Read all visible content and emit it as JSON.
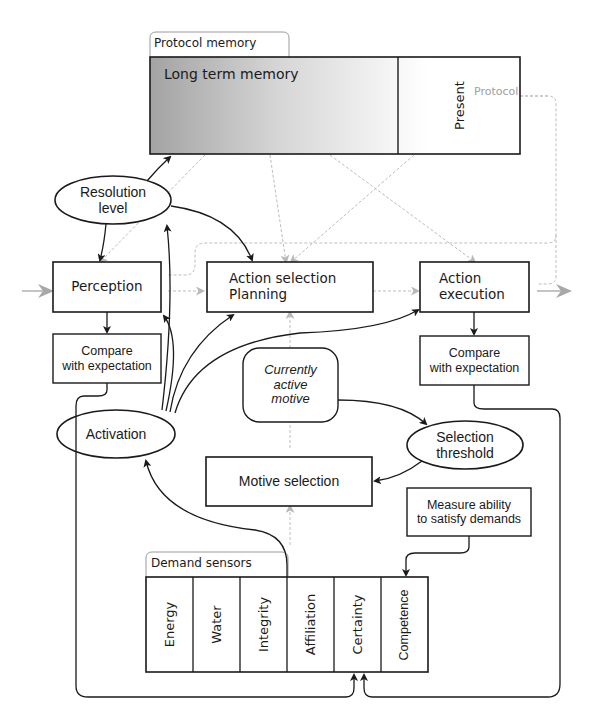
{
  "diagram": {
    "type": "psi-theory-architecture",
    "colors": {
      "line": "#1a1a1a",
      "faint_line": "#b5b5b5",
      "memory_gradient_start": "#a8a8a8",
      "memory_gradient_end": "#ffffff"
    },
    "memory": {
      "tab_label": "Protocol memory",
      "long_term_label": "Long term memory",
      "present_label": "Present",
      "protocol_label": "Protocol"
    },
    "nodes": {
      "resolution_level": "Resolution\nlevel",
      "perception": "Perception",
      "action_selection": "Action selection\nPlanning",
      "action_execution": "Action\nexecution",
      "compare_left": "Compare\nwith expectation",
      "compare_right": "Compare\nwith expectation",
      "currently_active_motive": "Currently\nactive\nmotive",
      "activation": "Activation",
      "selection_threshold": "Selection\nthreshold",
      "motive_selection": "Motive selection",
      "measure_ability": "Measure ability\nto satisfy demands"
    },
    "demand_sensors": {
      "tab_label": "Demand sensors",
      "items": [
        "Energy",
        "Water",
        "Integrity",
        "Affiliation",
        "Certainty",
        "Competence"
      ]
    },
    "edges": [
      {
        "from": "resolution_level",
        "to": "long_term_memory",
        "style": "solid"
      },
      {
        "from": "resolution_level",
        "to": "perception",
        "style": "solid"
      },
      {
        "from": "resolution_level",
        "to": "action_selection",
        "style": "solid"
      },
      {
        "from": "activation",
        "to": "resolution_level",
        "style": "solid"
      },
      {
        "from": "activation",
        "to": "perception",
        "style": "solid"
      },
      {
        "from": "activation",
        "to": "action_selection",
        "style": "solid"
      },
      {
        "from": "activation",
        "to": "action_execution",
        "style": "solid"
      },
      {
        "from": "perception",
        "to": "compare_left",
        "style": "solid"
      },
      {
        "from": "action_execution",
        "to": "compare_right",
        "style": "solid"
      },
      {
        "from": "currently_active_motive",
        "to": "selection_threshold",
        "style": "solid"
      },
      {
        "from": "selection_threshold",
        "to": "motive_selection",
        "style": "solid"
      },
      {
        "from": "demand_sensors",
        "to": "activation",
        "style": "solid"
      },
      {
        "from": "measure_ability",
        "to": "competence",
        "style": "solid"
      },
      {
        "from": "compare_left",
        "to": "certainty",
        "style": "solid"
      },
      {
        "from": "compare_right",
        "to": "certainty",
        "style": "solid"
      },
      {
        "from": "input",
        "to": "perception",
        "style": "faint"
      },
      {
        "from": "perception",
        "to": "action_selection",
        "style": "faint"
      },
      {
        "from": "action_selection",
        "to": "action_execution",
        "style": "faint"
      },
      {
        "from": "action_execution",
        "to": "output",
        "style": "faint"
      },
      {
        "from": "long_term_memory",
        "to": "perception",
        "style": "faint"
      },
      {
        "from": "long_term_memory",
        "to": "action_selection",
        "style": "faint"
      },
      {
        "from": "long_term_memory",
        "to": "action_execution",
        "style": "faint"
      },
      {
        "from": "present",
        "to": "action_selection",
        "style": "faint"
      },
      {
        "from": "protocol_loop",
        "to": "present",
        "style": "faint"
      },
      {
        "from": "motive_selection",
        "to": "currently_active_motive",
        "style": "faint"
      },
      {
        "from": "currently_active_motive",
        "to": "action_selection",
        "style": "faint"
      },
      {
        "from": "demand_sensors",
        "to": "motive_selection",
        "style": "faint"
      }
    ]
  }
}
